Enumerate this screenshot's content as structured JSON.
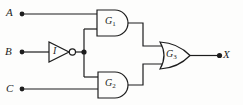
{
  "figure": {
    "kind": "logic-circuit-diagram",
    "inputs": [
      {
        "label": "A"
      },
      {
        "label": "B"
      },
      {
        "label": "C"
      }
    ],
    "output": {
      "label": "X"
    },
    "gates": [
      {
        "name": "G",
        "sub": "1",
        "type": "AND"
      },
      {
        "name": "G",
        "sub": "2",
        "type": "AND"
      },
      {
        "name": "G",
        "sub": "3",
        "type": "OR"
      }
    ],
    "inverter": {
      "label": "I",
      "type": "NOT"
    },
    "colors": {
      "line": "#1d1d1d",
      "background": "#fdfdfc"
    }
  }
}
